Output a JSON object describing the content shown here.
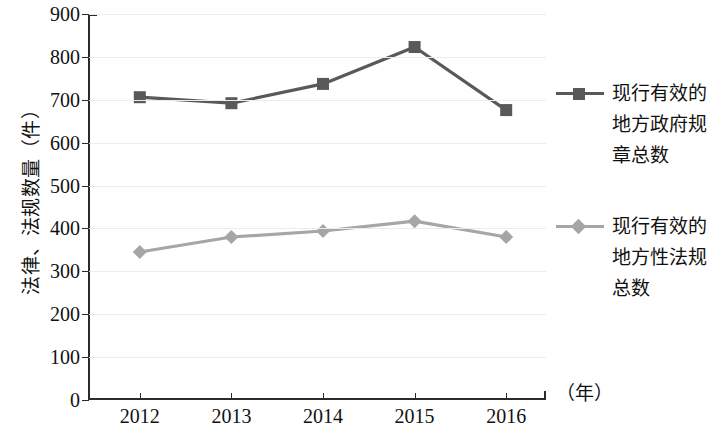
{
  "chart_data": {
    "type": "line",
    "title": "",
    "xlabel": "（年）",
    "ylabel": "法律、法规数量（件）",
    "categories": [
      "2012",
      "2013",
      "2014",
      "2015",
      "2016"
    ],
    "ylim": [
      0,
      900
    ],
    "yticks": [
      0,
      100,
      200,
      300,
      400,
      500,
      600,
      700,
      800,
      900
    ],
    "ytick_labels": [
      "0",
      "100",
      "200",
      "300",
      "400",
      "500",
      "600",
      "700",
      "800",
      "900"
    ],
    "grid": true,
    "legend_position": "right",
    "series": [
      {
        "name": "现行有效的地方政府规章总数",
        "name_lines": [
          "现行有效的",
          "地方政府规",
          "章总数"
        ],
        "color": "#595959",
        "marker": "square",
        "values": [
          706,
          692,
          737,
          823,
          676
        ]
      },
      {
        "name": "现行有效的地方性法规总数",
        "name_lines": [
          "现行有效的",
          "地方性法规",
          "总数"
        ],
        "color": "#a6a6a6",
        "marker": "diamond",
        "values": [
          345,
          380,
          394,
          417,
          380
        ]
      }
    ]
  },
  "axis": {
    "y_title": "法律、法规数量（件）",
    "x_unit": "（年）"
  },
  "colors": {
    "series_dark": "#595959",
    "series_light": "#a6a6a6",
    "axis": "#2b2b2b",
    "grid": "#ececec",
    "background": "#ffffff"
  }
}
